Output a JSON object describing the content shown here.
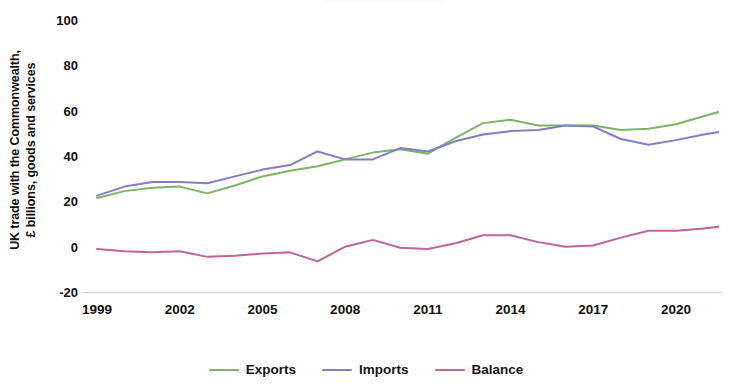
{
  "chart_data": {
    "type": "line",
    "title": "",
    "xlabel": "",
    "ylabel": "UK trade with the Commonwealth,\n£ billions, goods and services",
    "x": [
      1999,
      2000,
      2001,
      2002,
      2003,
      2004,
      2005,
      2006,
      2007,
      2008,
      2009,
      2010,
      2011,
      2012,
      2013,
      2014,
      2015,
      2016,
      2017,
      2018,
      2019,
      2020,
      2021,
      2022
    ],
    "xlim": [
      1999,
      2022
    ],
    "ylim": [
      -20,
      100
    ],
    "yticks": [
      100,
      80,
      60,
      40,
      20,
      0,
      -20
    ],
    "xticks": [
      1999,
      2002,
      2005,
      2008,
      2011,
      2014,
      2017,
      2020
    ],
    "grid": false,
    "legend_position": "bottom",
    "series": [
      {
        "name": "Exports",
        "color": "#7ab563",
        "values": [
          21.5,
          24.5,
          26.0,
          26.5,
          23.5,
          27.0,
          31.0,
          33.5,
          35.5,
          38.5,
          41.5,
          43.0,
          41.0,
          48.0,
          54.5,
          56.0,
          53.5,
          53.5,
          53.5,
          51.5,
          52.0,
          54.0,
          57.5,
          61.0
        ]
      },
      {
        "name": "Imports",
        "color": "#7e7ec9",
        "values": [
          22.5,
          26.5,
          28.5,
          28.5,
          28.0,
          31.0,
          34.0,
          36.0,
          42.0,
          38.5,
          38.5,
          43.5,
          42.0,
          46.5,
          49.5,
          51.0,
          51.5,
          53.5,
          53.0,
          47.5,
          45.0,
          47.0,
          49.5,
          51.5
        ]
      },
      {
        "name": "Balance",
        "color": "#c0649a",
        "values": [
          -1.0,
          -2.0,
          -2.5,
          -2.0,
          -4.5,
          -4.0,
          -3.0,
          -2.5,
          -6.5,
          0.0,
          3.0,
          -0.5,
          -1.0,
          1.5,
          5.0,
          5.0,
          2.0,
          0.0,
          0.5,
          4.0,
          7.0,
          7.0,
          8.0,
          9.5
        ]
      }
    ],
    "series_extended": {
      "note": "Values sampled annually 1999-2022 from the plotted polylines.",
      "exports_last": 80,
      "imports_last": 71,
      "balance_last": 6
    }
  },
  "axis": {
    "y_title": "UK trade with the Commonwealth,\n£ billions, goods and services",
    "y_tick_labels": [
      "100",
      "80",
      "60",
      "40",
      "20",
      "0",
      "-20"
    ],
    "x_tick_labels": [
      "1999",
      "2002",
      "2005",
      "2008",
      "2011",
      "2014",
      "2017",
      "2020"
    ]
  },
  "legend": {
    "items": [
      {
        "label": "Exports",
        "color": "#7ab563"
      },
      {
        "label": "Imports",
        "color": "#7e7ec9"
      },
      {
        "label": "Balance",
        "color": "#c0649a"
      }
    ]
  }
}
